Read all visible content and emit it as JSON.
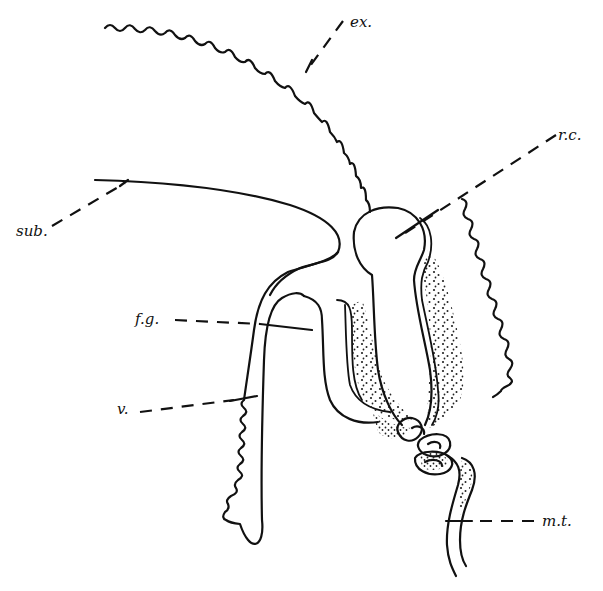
{
  "figure": {
    "type": "anatomical line drawing (longitudinal section)",
    "background": "#ffffff",
    "ink_color": "#111111",
    "labels": [
      {
        "id": "ex",
        "text": "ex.",
        "x": 350,
        "y": 14
      },
      {
        "id": "rc",
        "text": "r.c.",
        "x": 563,
        "y": 128
      },
      {
        "id": "sub",
        "text": "sub.",
        "x": 16,
        "y": 224
      },
      {
        "id": "fg",
        "text": "f.g.",
        "x": 135,
        "y": 312
      },
      {
        "id": "v",
        "text": "v.",
        "x": 117,
        "y": 399
      },
      {
        "id": "mt",
        "text": "m.t.",
        "x": 542,
        "y": 515
      }
    ]
  }
}
